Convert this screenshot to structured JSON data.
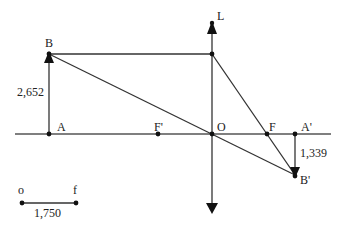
{
  "diagram": {
    "type": "thin converging lens ray diagram",
    "colors": {
      "line": "#333333",
      "point": "#111111",
      "background": "#ffffff"
    },
    "lens": {
      "label": "L"
    },
    "points": {
      "A": "A",
      "B": "B",
      "F_prime": "F'",
      "O": "O",
      "F": "F",
      "A_prime": "A'",
      "B_prime": "B'"
    },
    "measurements": {
      "object_height": "2,652",
      "image_height": "1,339"
    },
    "scale_bar": {
      "left_label": "o",
      "right_label": "f",
      "value": "1,750"
    }
  }
}
